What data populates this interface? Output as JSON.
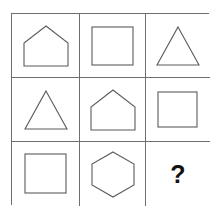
{
  "puzzle": {
    "type": "matrix-reasoning-3x3",
    "rows": 3,
    "columns": 3,
    "border_color": "#6e6e6e",
    "shape_stroke_color": "#5b5b5b",
    "background_color": "#ffffff",
    "question_mark_color": "#111111",
    "cells": [
      {
        "id": "cell-r1c1",
        "row": 1,
        "column": 1,
        "shape": "pentagon-house",
        "label": "house pentagon"
      },
      {
        "id": "cell-r1c2",
        "row": 1,
        "column": 2,
        "shape": "square",
        "label": "square"
      },
      {
        "id": "cell-r1c3",
        "row": 1,
        "column": 3,
        "shape": "triangle",
        "label": "triangle"
      },
      {
        "id": "cell-r2c1",
        "row": 2,
        "column": 1,
        "shape": "triangle",
        "label": "triangle"
      },
      {
        "id": "cell-r2c2",
        "row": 2,
        "column": 2,
        "shape": "pentagon-house",
        "label": "house pentagon"
      },
      {
        "id": "cell-r2c3",
        "row": 2,
        "column": 3,
        "shape": "square",
        "label": "square"
      },
      {
        "id": "cell-r3c1",
        "row": 3,
        "column": 1,
        "shape": "square",
        "label": "square"
      },
      {
        "id": "cell-r3c2",
        "row": 3,
        "column": 2,
        "shape": "hexagon",
        "label": "hexagon"
      },
      {
        "id": "cell-r3c3",
        "row": 3,
        "column": 3,
        "shape": "question-mark",
        "label": "?",
        "text": "?"
      }
    ]
  }
}
